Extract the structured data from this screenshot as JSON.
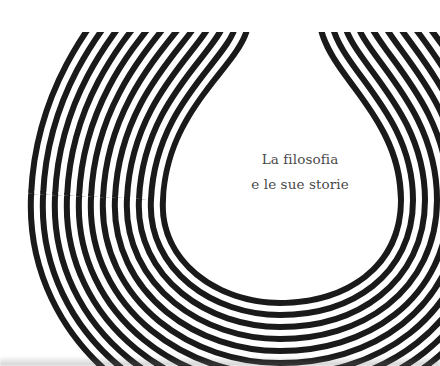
{
  "cover": {
    "title_line_1": "La filosofia",
    "title_line_2": "e le sue storie",
    "pattern": {
      "shape": "drop",
      "stripe_count": 11,
      "stripe_color": "#1a1a1a",
      "background_color": "#ffffff"
    },
    "text_color": "#4a4a4a"
  }
}
